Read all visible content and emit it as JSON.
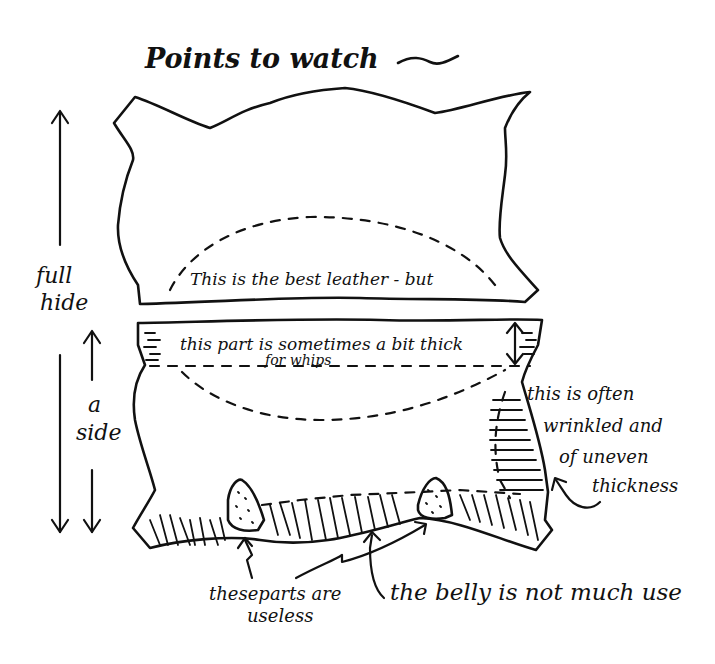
{
  "diagram": {
    "title": "Points to watch",
    "title_flourish": "~",
    "dimension_labels": {
      "full_hide": [
        "full",
        "hide"
      ],
      "a_side": [
        "a",
        "side"
      ]
    },
    "regions": {
      "full_hide_label": "full hide",
      "side_label": "a side",
      "best_leather": "This is the best leather - but",
      "top_strip": [
        "this part is sometimes a bit thick",
        "for whips"
      ],
      "shoulder_note": [
        "this is often",
        "wrinkled and",
        "of uneven",
        "thickness"
      ],
      "useless_parts": [
        "theseparts are",
        "useless"
      ],
      "belly": "the belly is not much use"
    },
    "colors": {
      "ink": "#111111",
      "paper": "#ffffff"
    }
  }
}
